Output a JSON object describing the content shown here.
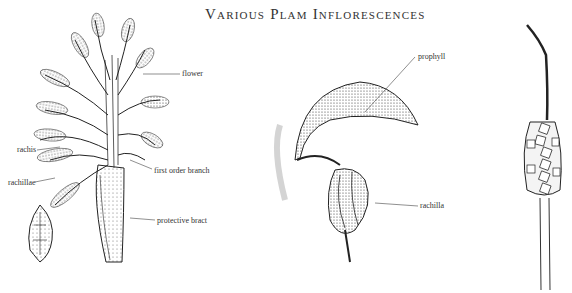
{
  "title": "Various Plam Inflorescences",
  "figures": [
    {
      "name": "branched-inflorescence",
      "labels": [
        {
          "id": "flower",
          "text": "flower"
        },
        {
          "id": "rachis",
          "text": "rachis"
        },
        {
          "id": "rachillae",
          "text": "rachillae"
        },
        {
          "id": "first_order_branch",
          "text": "first order branch"
        },
        {
          "id": "protective_bract",
          "text": "protective bract"
        }
      ]
    },
    {
      "name": "prophyll-inflorescence",
      "labels": [
        {
          "id": "prophyll",
          "text": "prophyll"
        },
        {
          "id": "rachilla",
          "text": "rachilla"
        }
      ]
    },
    {
      "name": "spike-inflorescence",
      "labels": []
    }
  ],
  "colors": {
    "ink": "#222222",
    "background": "#ffffff"
  }
}
